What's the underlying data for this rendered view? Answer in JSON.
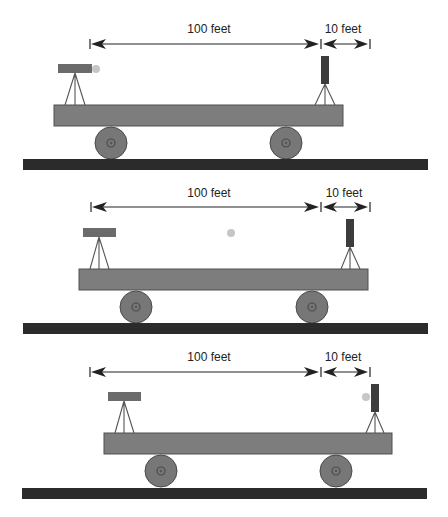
{
  "diagram": {
    "colors": {
      "text": "#222222",
      "platform": "#7d7d7d",
      "wheel": "#777777",
      "rail": "#2b2b2b",
      "laser": "#6b6b6b",
      "target": "#3c3c3c",
      "dot": "#c6c6c6"
    },
    "panels": [
      {
        "name": "panel-1",
        "dim_long_label": "100 feet",
        "dim_short_label": "10 feet",
        "dot_position": "at laser"
      },
      {
        "name": "panel-2",
        "dim_long_label": "100 feet",
        "dim_short_label": "10 feet",
        "dot_position": "midway"
      },
      {
        "name": "panel-3",
        "dim_long_label": "100 feet",
        "dim_short_label": "10 feet",
        "dot_position": "at target"
      }
    ]
  }
}
